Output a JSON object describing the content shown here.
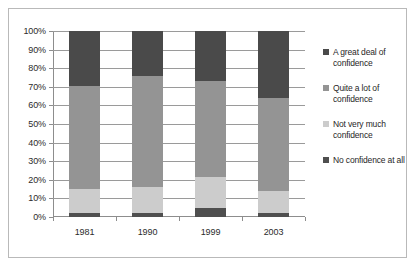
{
  "chart_data": {
    "type": "bar",
    "subtype": "stacked-100-percent",
    "title": "",
    "xlabel": "",
    "ylabel": "",
    "ylim": [
      0,
      100
    ],
    "grid": true,
    "legend_position": "right",
    "categories": [
      "1981",
      "1990",
      "1999",
      "2003"
    ],
    "ytick_labels": [
      "0%",
      "10%",
      "20%",
      "30%",
      "40%",
      "50%",
      "60%",
      "70%",
      "80%",
      "90%",
      "100%"
    ],
    "ytick_values": [
      0,
      10,
      20,
      30,
      40,
      50,
      60,
      70,
      80,
      90,
      100
    ],
    "series": [
      {
        "name": "No confidence at all",
        "color": "#4f4f4f",
        "values": [
          2,
          2,
          5,
          2
        ]
      },
      {
        "name": "Not very much confidence",
        "color": "#cccccc",
        "values": [
          13,
          14,
          16.5,
          12
        ]
      },
      {
        "name": "Quite a lot of confidence",
        "color": "#949494",
        "values": [
          55.5,
          60,
          51.5,
          50
        ]
      },
      {
        "name": "A great deal of confidence",
        "color": "#4a4a4a",
        "values": [
          29.5,
          24,
          27,
          36
        ]
      }
    ],
    "stack_order_bottom_to_top": [
      "No confidence at all",
      "Not very much confidence",
      "Quite a lot of confidence",
      "A great deal of confidence"
    ],
    "legend_entries": [
      {
        "label": "A great deal of confidence",
        "color": "#4a4a4a"
      },
      {
        "label": "Quite a lot of confidence",
        "color": "#949494"
      },
      {
        "label": "Not very much confidence",
        "color": "#cccccc"
      },
      {
        "label": "No confidence at all",
        "color": "#4f4f4f"
      }
    ]
  }
}
